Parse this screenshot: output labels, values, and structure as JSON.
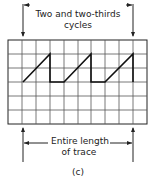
{
  "top_label": {
    "line1": "Two and two-thirds",
    "line2": "cycles"
  },
  "bottom_label": {
    "line1": "Entire length",
    "line2": "of trace"
  },
  "caption": "(c)",
  "grid": {
    "columns": 10,
    "rows": 6
  },
  "colors": {
    "line": "#222222",
    "grid": "#555555",
    "background": "#ffffff"
  },
  "waveform": {
    "type": "sawtooth",
    "cycles_shown": "2 2/3"
  }
}
